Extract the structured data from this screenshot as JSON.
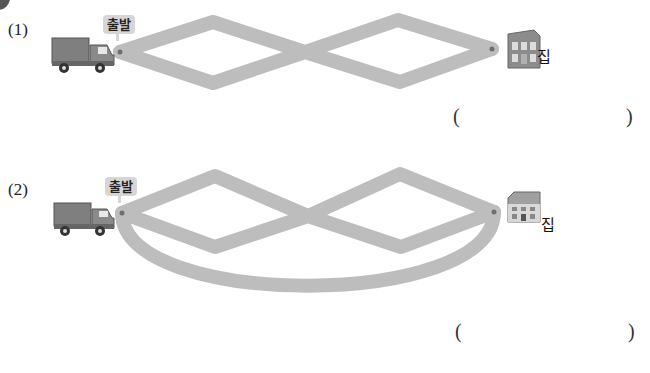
{
  "problems": [
    {
      "number": "(1)",
      "start_label": "출발",
      "end_label": "집",
      "route_type": "two-diamonds",
      "answer": {
        "open_paren": "(",
        "close_paren": ")",
        "value": ""
      }
    },
    {
      "number": "(2)",
      "start_label": "출발",
      "end_label": "집",
      "route_type": "two-diamonds-with-lower-arc",
      "answer": {
        "open_paren": "(",
        "close_paren": ")",
        "value": ""
      }
    }
  ],
  "colors": {
    "road": "#bdbdbd",
    "node": "#6e6e6e",
    "bubble": "#d6d6d6",
    "truck_body": "#7f7f7f",
    "house": "#8c8c8c"
  },
  "icons": {
    "start_vehicle": "truck-icon",
    "destination": "house-icon"
  }
}
